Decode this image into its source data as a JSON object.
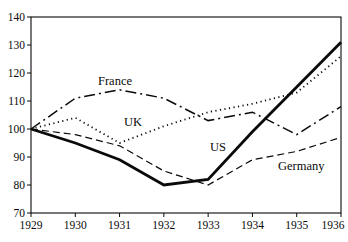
{
  "chart_data": {
    "type": "line",
    "title": "",
    "xlabel": "",
    "ylabel": "",
    "categories": [
      "1929",
      "1930",
      "1931",
      "1932",
      "1933",
      "1934",
      "1935",
      "1936"
    ],
    "ylim": [
      70,
      140
    ],
    "yticks": [
      70,
      80,
      90,
      100,
      110,
      120,
      130,
      140
    ],
    "grid": false,
    "legend_position": "inline-labels",
    "line_color": "#0a0a0a",
    "background_color": "#ffffff",
    "series": [
      {
        "name": "France",
        "style": "dashdot",
        "values": [
          100,
          111,
          114,
          111,
          103,
          106,
          98,
          108
        ],
        "label_x": 98,
        "label_y": 85
      },
      {
        "name": "UK",
        "style": "dotted",
        "values": [
          100,
          104,
          95,
          101,
          106,
          109,
          113,
          126
        ],
        "label_x": 124,
        "label_y": 126
      },
      {
        "name": "US",
        "style": "solid-thick",
        "values": [
          100,
          95,
          89,
          80,
          82,
          99,
          115,
          131
        ],
        "label_x": 210,
        "label_y": 151
      },
      {
        "name": "Germany",
        "style": "dashed",
        "values": [
          100,
          98,
          94,
          85,
          80,
          89,
          92,
          97
        ],
        "label_x": 278,
        "label_y": 170
      }
    ]
  }
}
